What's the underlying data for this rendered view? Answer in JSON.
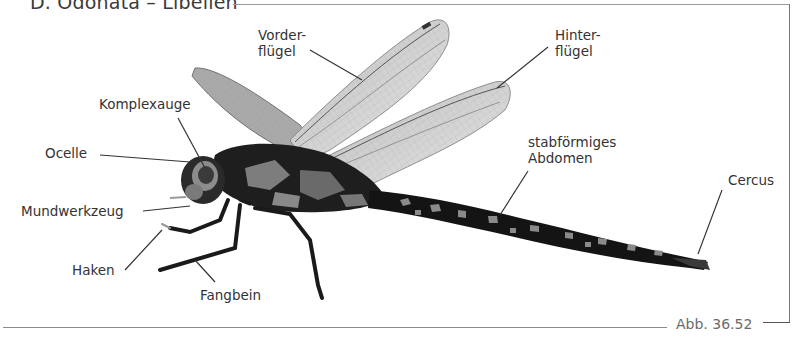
{
  "figure": {
    "title": "D. Odonata – Libellen",
    "caption": "Abb. 36.52"
  },
  "labels": {
    "vorderfluegel_1": "Vorder-",
    "vorderfluegel_2": "flügel",
    "hinterfluegel_1": "Hinter-",
    "hinterfluegel_2": "flügel",
    "komplexauge": "Komplexauge",
    "ocelle": "Ocelle",
    "mundwerkzeug": "Mundwerkzeug",
    "haken": "Haken",
    "fangbein": "Fangbein",
    "abdomen_1": "stabförmiges",
    "abdomen_2": "Abdomen",
    "cercus": "Cercus"
  },
  "colors": {
    "text": "#333333",
    "leader_line": "#333333",
    "frame": "#8a8a8a",
    "body_dark": "#1a1a1a",
    "body_mid": "#6e6e6e",
    "wing": "#d6d6d6"
  }
}
